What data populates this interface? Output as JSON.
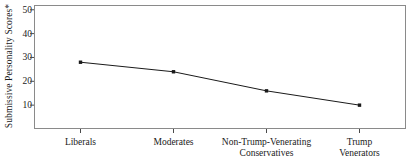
{
  "chart_data": {
    "type": "line",
    "title": "",
    "xlabel": "",
    "ylabel": "Submissive Personality Scores*",
    "categories": [
      "Liberals",
      "Moderates",
      "Non-Trump-Venerating\nConservatives",
      "Trump\nVenerators"
    ],
    "values": [
      28,
      24,
      16,
      10
    ],
    "ylim": [
      0,
      52
    ],
    "yticks": [
      10,
      20,
      30,
      40,
      50
    ],
    "ytick_labels": [
      "10",
      "20",
      "30",
      "40",
      "50"
    ],
    "grid": false,
    "legend": null,
    "series": [
      {
        "name": "Submissive Personality Scores",
        "values": [
          28,
          24,
          16,
          10
        ],
        "marker": "filled-square",
        "line_color": "#1a1a1a",
        "marker_color": "#1a1a1a"
      }
    ],
    "frame": true,
    "frame_color": "#8a8a8a"
  }
}
